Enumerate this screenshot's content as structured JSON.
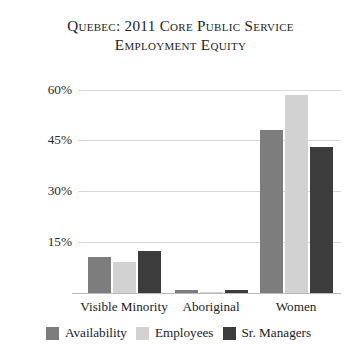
{
  "chart_data": {
    "type": "bar",
    "title": "Quebec: 2011 Core Public Service\nEmployment Equity",
    "title_line1": "Quebec: 2011 Core Public Service",
    "title_line2": "Employment Equity",
    "xlabel": "",
    "ylabel": "",
    "categories": [
      "Visible Minority",
      "Aboriginal",
      "Women"
    ],
    "series": [
      {
        "name": "Availability",
        "color": "#7d7d7d",
        "values": [
          10.5,
          1.0,
          48.0
        ]
      },
      {
        "name": "Employees",
        "color": "#d2d2d2",
        "values": [
          9.0,
          0.4,
          58.5
        ]
      },
      {
        "name": "Sr. Managers",
        "color": "#3c3c3c",
        "values": [
          12.5,
          0.9,
          43.0
        ]
      }
    ],
    "ylim": [
      0,
      64
    ],
    "yticks": [
      15,
      30,
      45,
      60
    ],
    "ytick_labels": [
      "15%",
      "30%",
      "45%",
      "60%"
    ],
    "grid": true,
    "legend_position": "bottom",
    "value_suffix": "%"
  },
  "colors": {
    "availability": "#7d7d7d",
    "employees": "#d2d2d2",
    "sr_managers": "#3c3c3c",
    "gridline": "#d8d8d8",
    "text": "#222222",
    "background": "#ffffff"
  }
}
